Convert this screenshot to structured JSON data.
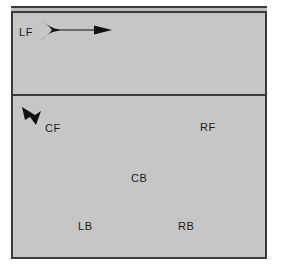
{
  "figure": {
    "background_color": "#ffffff",
    "panel_color": "#c6c6c6",
    "border_color": "#3a3a3a",
    "marker_color": "#111111",
    "text_color": "#1a1a1a"
  },
  "panels": {
    "upper": {
      "name": "upper-panel"
    },
    "lower": {
      "name": "lower-panel"
    }
  },
  "labels": [
    {
      "id": "LF",
      "text": "LF",
      "panel": "upper",
      "x": 19,
      "y": 27
    },
    {
      "id": "CF",
      "text": "CF",
      "panel": "lower",
      "x": 45,
      "y": 123
    },
    {
      "id": "RF",
      "text": "RF",
      "panel": "lower",
      "x": 200,
      "y": 122
    },
    {
      "id": "CB",
      "text": "CB",
      "panel": "lower",
      "x": 131,
      "y": 173
    },
    {
      "id": "LB",
      "text": "LB",
      "panel": "lower",
      "x": 78,
      "y": 221
    },
    {
      "id": "RB",
      "text": "RB",
      "panel": "lower",
      "x": 178,
      "y": 221
    }
  ],
  "markers": {
    "flow_arrow": {
      "name": "flared-flow-arrow",
      "direction": "right",
      "panel": "upper",
      "x": 38,
      "y": 19,
      "width": 76,
      "height": 21
    },
    "chevron_arrow": {
      "name": "chevron-arrowhead",
      "direction": "up-left",
      "panel": "lower",
      "x": 20,
      "y": 103,
      "width": 26,
      "height": 26
    }
  }
}
